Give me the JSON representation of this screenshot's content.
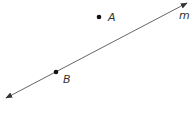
{
  "diagram": {
    "type": "geometry",
    "line": {
      "label": "m",
      "start": [
        6,
        98
      ],
      "end": [
        187,
        3
      ],
      "arrows": "both",
      "color": "#555555"
    },
    "points": [
      {
        "label": "A",
        "x": 99,
        "y": 17,
        "on_line": false
      },
      {
        "label": "B",
        "x": 56,
        "y": 72,
        "on_line": true
      }
    ],
    "point_color": "#111111"
  }
}
